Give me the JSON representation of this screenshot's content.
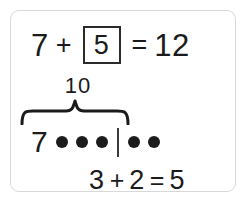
{
  "card": {
    "border_color": "#d8d8d8",
    "background": "#ffffff",
    "ink_color": "#1b1b1b"
  },
  "top_equation": {
    "first_addend": "7",
    "plus_sign": "+",
    "answer_box_value": "5",
    "equals_sign": "=",
    "sum": "12"
  },
  "brace": {
    "label": "10"
  },
  "dots_row": {
    "leading_numeral": "7",
    "left_group_count": 3,
    "right_group_count": 2,
    "divider": "|"
  },
  "bottom_equation": {
    "first_addend": "3",
    "plus_sign": "+",
    "second_addend": "2",
    "equals_sign": "=",
    "sum": "5"
  }
}
